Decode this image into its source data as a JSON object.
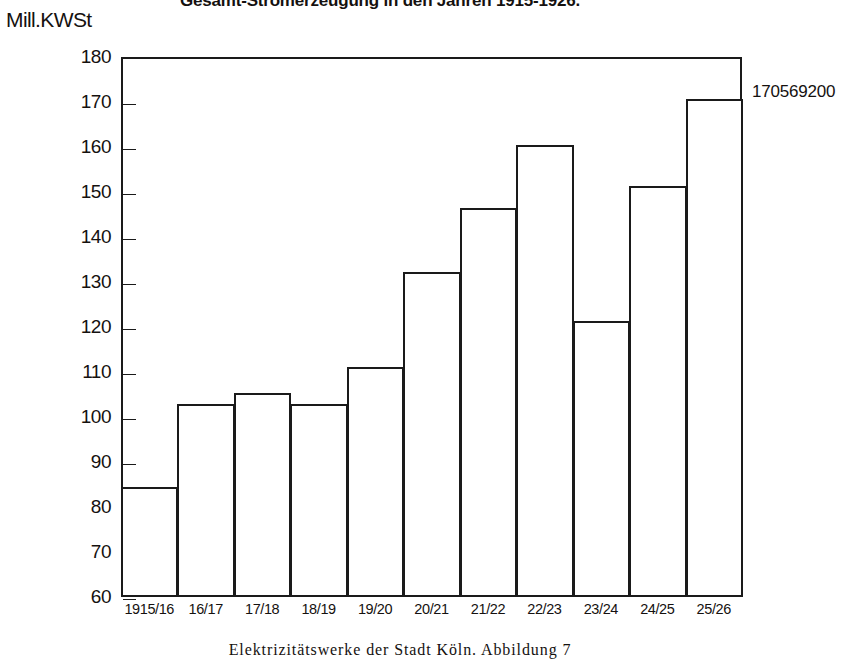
{
  "chart_data": {
    "type": "bar",
    "title": "Gesamt-Stromerzeugung in den Jahren 1915-1926.",
    "xlabel": "",
    "ylabel": "Mill.KWSt",
    "ylim": [
      60,
      180
    ],
    "yticks": [
      60,
      70,
      80,
      90,
      100,
      110,
      120,
      130,
      140,
      150,
      160,
      170,
      180
    ],
    "grid": false,
    "legend": null,
    "categories": [
      "1915/16",
      "16/17",
      "17/18",
      "18/19",
      "19/20",
      "20/21",
      "21/22",
      "22/23",
      "23/24",
      "24/25",
      "25/26"
    ],
    "values": [
      84.5,
      103.0,
      105.3,
      102.8,
      111.2,
      132.3,
      146.4,
      160.4,
      121.3,
      151.3,
      170.6
    ],
    "annotations": [
      {
        "text": "170569200",
        "category": "25/26"
      }
    ]
  },
  "caption": {
    "text": "Elektrizitätswerke der Stadt Köln.  Abbildung 7"
  },
  "colors": {
    "ink": "#1a1a1a",
    "paper": "#ffffff"
  }
}
